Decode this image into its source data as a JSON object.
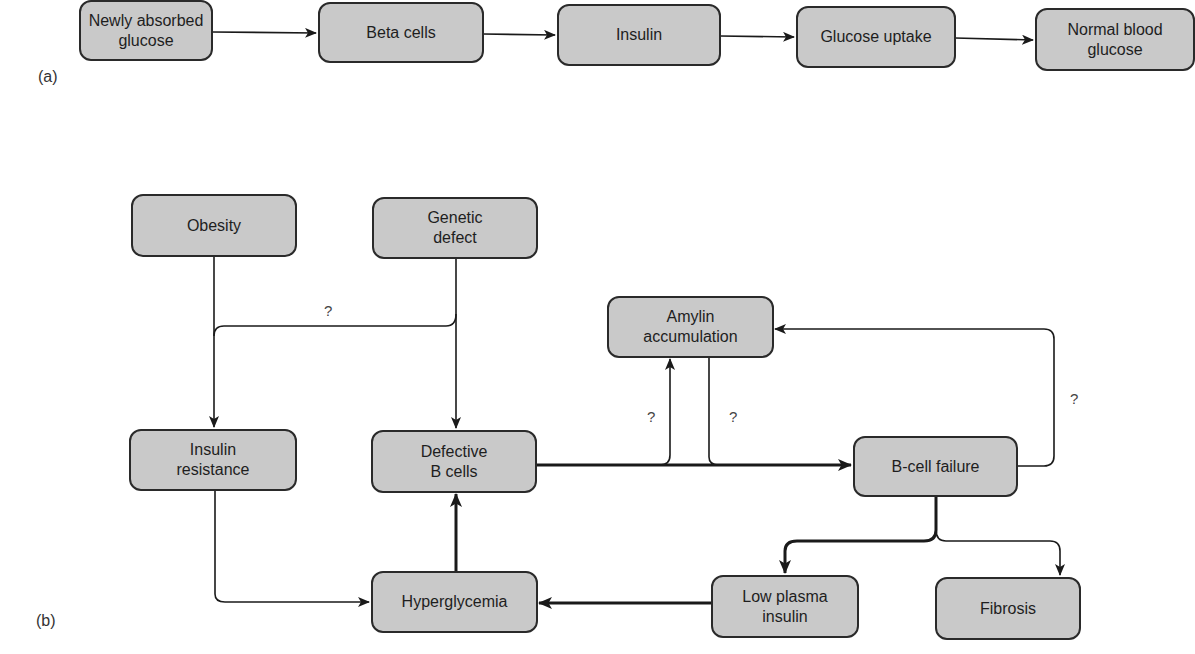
{
  "panel_a": {
    "label": "(a)",
    "nodes": [
      {
        "id": "newly_absorbed_glucose",
        "text": "Newly absorbed\nglucose"
      },
      {
        "id": "beta_cells",
        "text": "Beta cells"
      },
      {
        "id": "insulin",
        "text": "Insulin"
      },
      {
        "id": "glucose_uptake",
        "text": "Glucose uptake"
      },
      {
        "id": "normal_blood_glucose",
        "text": "Normal blood\nglucose"
      }
    ],
    "edges": [
      {
        "from": "newly_absorbed_glucose",
        "to": "beta_cells"
      },
      {
        "from": "beta_cells",
        "to": "insulin"
      },
      {
        "from": "insulin",
        "to": "glucose_uptake"
      },
      {
        "from": "glucose_uptake",
        "to": "normal_blood_glucose"
      }
    ]
  },
  "panel_b": {
    "label": "(b)",
    "nodes": [
      {
        "id": "obesity",
        "text": "Obesity"
      },
      {
        "id": "genetic_defect",
        "text": "Genetic\ndefect"
      },
      {
        "id": "amylin_accumulation",
        "text": "Amylin\naccumulation"
      },
      {
        "id": "insulin_resistance",
        "text": "Insulin\nresistance"
      },
      {
        "id": "defective_b_cells",
        "text": "Defective\nB cells"
      },
      {
        "id": "b_cell_failure",
        "text": "B-cell failure"
      },
      {
        "id": "hyperglycemia",
        "text": "Hyperglycemia"
      },
      {
        "id": "low_plasma_insulin",
        "text": "Low plasma\ninsulin"
      },
      {
        "id": "fibrosis",
        "text": "Fibrosis"
      }
    ],
    "edges": [
      {
        "from": "obesity",
        "to": "insulin_resistance",
        "label": ""
      },
      {
        "from": "genetic_defect",
        "to": "defective_b_cells",
        "label": ""
      },
      {
        "from": "genetic_defect",
        "to": "insulin_resistance",
        "label": "?"
      },
      {
        "from": "defective_b_cells",
        "to": "b_cell_failure",
        "label": "",
        "weight": "bold"
      },
      {
        "from": "defective_b_cells",
        "to": "amylin_accumulation",
        "label": "?"
      },
      {
        "from": "amylin_accumulation",
        "to": "b_cell_failure",
        "label": "?"
      },
      {
        "from": "b_cell_failure",
        "to": "amylin_accumulation",
        "label": "?"
      },
      {
        "from": "b_cell_failure",
        "to": "low_plasma_insulin",
        "label": "",
        "weight": "bold"
      },
      {
        "from": "b_cell_failure",
        "to": "fibrosis",
        "label": ""
      },
      {
        "from": "low_plasma_insulin",
        "to": "hyperglycemia",
        "label": "",
        "weight": "bold"
      },
      {
        "from": "hyperglycemia",
        "to": "defective_b_cells",
        "label": "",
        "weight": "bold"
      },
      {
        "from": "insulin_resistance",
        "to": "hyperglycemia",
        "label": ""
      }
    ],
    "question_marks": [
      "?",
      "?",
      "?",
      "?"
    ]
  },
  "colors": {
    "node_fill": "#c9c9c9",
    "node_border": "#2a2a2a",
    "edge": "#1a1a1a",
    "background": "#ffffff"
  }
}
